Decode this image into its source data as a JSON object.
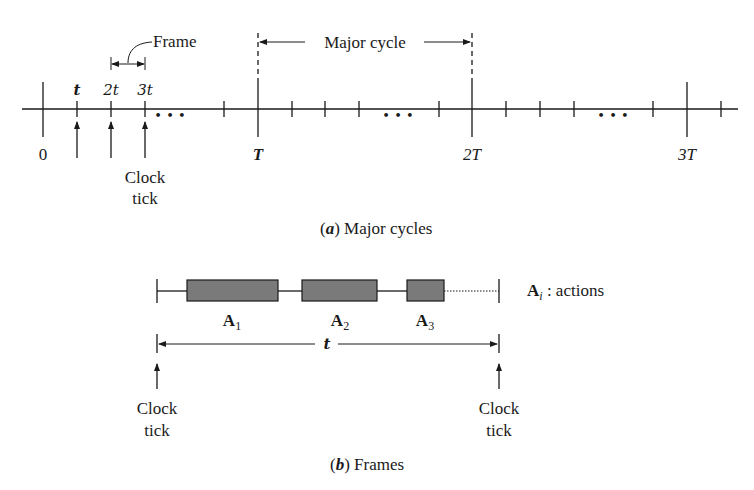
{
  "figure_a": {
    "caption_label": "a",
    "caption_text": " Major cycles",
    "frame_label": "Frame",
    "major_cycle_label": "Major cycle",
    "tick_labels_top": [
      "t",
      "2t",
      "3t"
    ],
    "tick_labels_bottom": [
      "0",
      "T",
      "2T",
      "3T"
    ],
    "ellipsis": "• • •",
    "clock_tick_label_line1": "Clock",
    "clock_tick_label_line2": "tick"
  },
  "figure_b": {
    "caption_label": "b",
    "caption_text": " Frames",
    "actions": [
      {
        "label": "A",
        "sub": "1"
      },
      {
        "label": "A",
        "sub": "2"
      },
      {
        "label": "A",
        "sub": "3"
      }
    ],
    "legend_label": "A",
    "legend_sub": "i",
    "legend_text": " : actions",
    "duration_label": "t",
    "clock_tick_label_line1": "Clock",
    "clock_tick_label_line2": "tick"
  },
  "colors": {
    "ink": "#1a1a1a",
    "action_fill": "#7a7a7a",
    "background": "#ffffff"
  }
}
